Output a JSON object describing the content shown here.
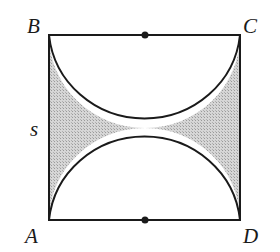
{
  "diagram": {
    "labels": {
      "A": "A",
      "B": "B",
      "C": "C",
      "D": "D",
      "side": "s"
    },
    "colors": {
      "stroke": "#1a1a1a",
      "shade": "#c8c8c8",
      "background": "#ffffff"
    },
    "shapes": {
      "square": {
        "x": 49,
        "y": 35,
        "w": 191,
        "h": 185
      },
      "top_semicircle": {
        "cx": 145,
        "cy": 35,
        "r": 95,
        "center_label": "midpoint of BC"
      },
      "bottom_semicircle": {
        "cx": 145,
        "cy": 220,
        "r": 95,
        "center_label": "midpoint of AD"
      },
      "shaded_region": "area inside square outside both semicircles (left and right)"
    }
  }
}
